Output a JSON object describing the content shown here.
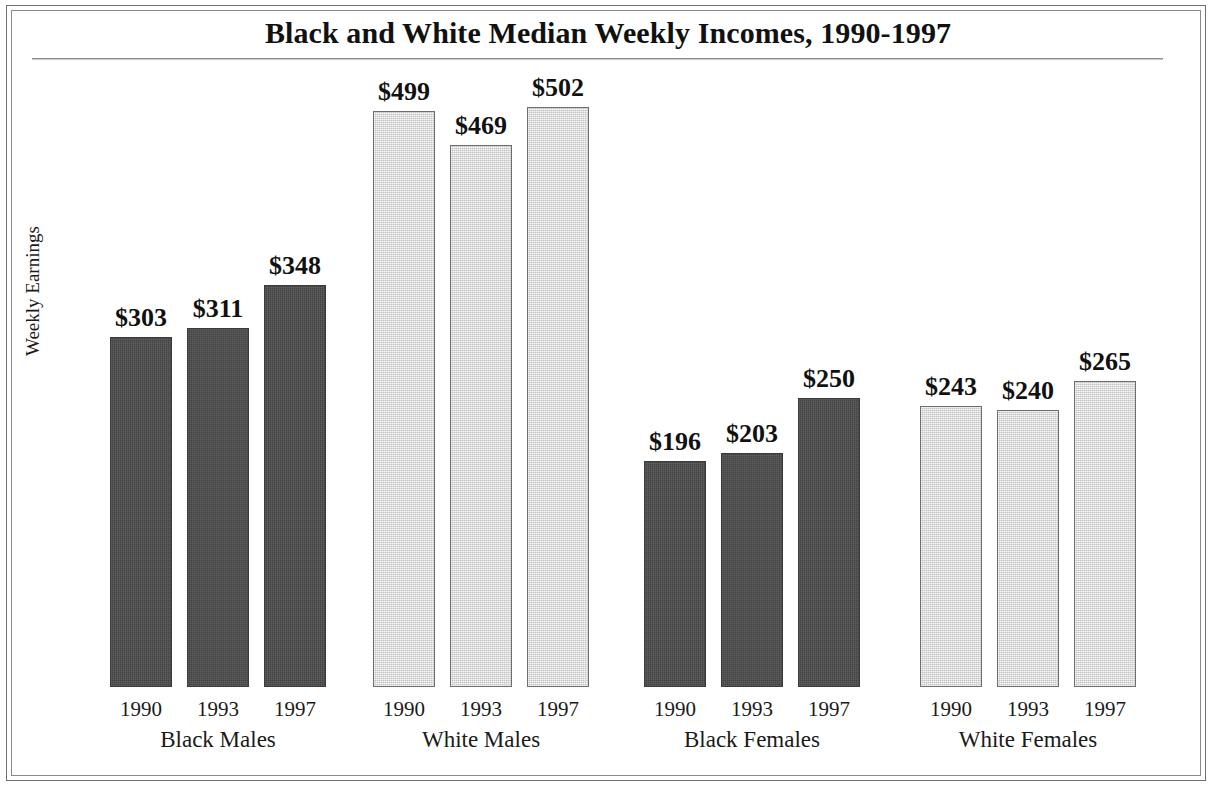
{
  "figure": {
    "title": "Black and White Median Weekly Incomes, 1990-1997",
    "y_axis_title": "Weekly Earnings",
    "frame_color": "#6f6f6f",
    "background": "#ffffff"
  },
  "chart_data": {
    "type": "bar",
    "title": "Black and White Median Weekly Incomes, 1990-1997",
    "xlabel": "",
    "ylabel": "Weekly Earnings",
    "ylim": [
      0,
      560
    ],
    "grid": false,
    "legend": "none",
    "categories": [
      "1990",
      "1993",
      "1997"
    ],
    "groups": [
      {
        "name": "Black Males",
        "color": "#4a4a4a",
        "style": "dark",
        "points": [
          {
            "year": "1990",
            "value": 303,
            "label": "$303"
          },
          {
            "year": "1993",
            "value": 311,
            "label": "$311"
          },
          {
            "year": "1997",
            "value": 348,
            "label": "$348"
          }
        ]
      },
      {
        "name": "White Males",
        "color": "#d6d6d6",
        "style": "light",
        "points": [
          {
            "year": "1990",
            "value": 499,
            "label": "$499"
          },
          {
            "year": "1993",
            "value": 469,
            "label": "$469"
          },
          {
            "year": "1997",
            "value": 502,
            "label": "$502"
          }
        ]
      },
      {
        "name": "Black Females",
        "color": "#4a4a4a",
        "style": "dark",
        "points": [
          {
            "year": "1990",
            "value": 196,
            "label": "$196"
          },
          {
            "year": "1993",
            "value": 203,
            "label": "$203"
          },
          {
            "year": "1997",
            "value": 250,
            "label": "$250"
          }
        ]
      },
      {
        "name": "White Females",
        "color": "#d6d6d6",
        "style": "light",
        "points": [
          {
            "year": "1990",
            "value": 243,
            "label": "$243"
          },
          {
            "year": "1993",
            "value": 240,
            "label": "$240"
          },
          {
            "year": "1997",
            "value": 265,
            "label": "$265"
          }
        ]
      }
    ]
  },
  "layout": {
    "baseline_y": 687,
    "px_per_dollar": 1.155,
    "bar_width": 62,
    "group_left_x": [
      110,
      373,
      644,
      920
    ],
    "bar_pitch": 77
  }
}
